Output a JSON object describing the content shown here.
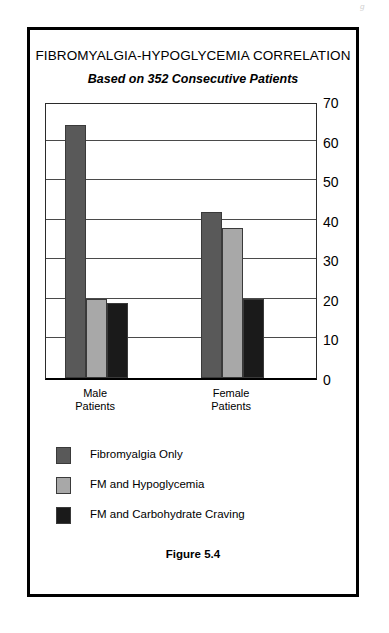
{
  "artifact": {
    "text": "g"
  },
  "figure": {
    "caption": "Figure 5.4"
  },
  "chart_data": {
    "type": "bar",
    "title": "FIBROMYALGIA-HYPOGLYCEMIA CORRELATION",
    "subtitle": "Based on 352 Consecutive Patients",
    "xlabel": "",
    "ylabel": "",
    "ylim": [
      0,
      70
    ],
    "ytick_step": 10,
    "yticks": [
      70,
      60,
      50,
      40,
      30,
      20,
      10,
      0
    ],
    "grid": true,
    "y_axis_position": "right",
    "legend_position": "below",
    "categories": [
      "Male\nPatients",
      "Female\nPatients"
    ],
    "category_labels": [
      {
        "line1": "Male",
        "line2": "Patients"
      },
      {
        "line1": "Female",
        "line2": "Patients"
      }
    ],
    "series": [
      {
        "name": "Fibromyalgia Only",
        "color": "#595959",
        "values": [
          64,
          42
        ]
      },
      {
        "name": "FM and Hypoglycemia",
        "color": "#a8a8a8",
        "values": [
          20,
          38
        ]
      },
      {
        "name": "FM and Carbohydrate Craving",
        "color": "#1a1a1a",
        "values": [
          19,
          20
        ]
      }
    ]
  }
}
